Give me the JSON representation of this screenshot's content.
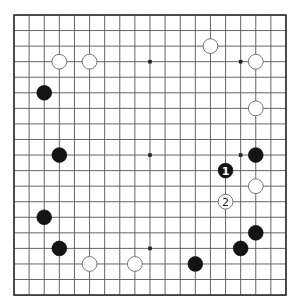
{
  "board": {
    "size": 19,
    "origin": {
      "x": 14,
      "y": 15
    },
    "spacing": {
      "x": 15.11,
      "y": 15.56
    },
    "star_points": [
      [
        3,
        3
      ],
      [
        9,
        3
      ],
      [
        15,
        3
      ],
      [
        3,
        9
      ],
      [
        9,
        9
      ],
      [
        15,
        9
      ],
      [
        3,
        15
      ],
      [
        9,
        15
      ],
      [
        15,
        15
      ]
    ],
    "colors": {
      "line": "#555555",
      "edge": "#333333",
      "black": "#141414",
      "white": "#ffffff"
    }
  },
  "stones": [
    {
      "color": "white",
      "col": 3,
      "row": 3,
      "label": ""
    },
    {
      "color": "white",
      "col": 5,
      "row": 3,
      "label": ""
    },
    {
      "color": "white",
      "col": 13,
      "row": 2,
      "label": ""
    },
    {
      "color": "white",
      "col": 16,
      "row": 3,
      "label": ""
    },
    {
      "color": "white",
      "col": 16,
      "row": 6,
      "label": ""
    },
    {
      "color": "white",
      "col": 16,
      "row": 11,
      "label": ""
    },
    {
      "color": "white",
      "col": 14,
      "row": 12,
      "label": "2"
    },
    {
      "color": "white",
      "col": 5,
      "row": 16,
      "label": ""
    },
    {
      "color": "white",
      "col": 8,
      "row": 16,
      "label": ""
    },
    {
      "color": "black",
      "col": 2,
      "row": 5,
      "label": ""
    },
    {
      "color": "black",
      "col": 3,
      "row": 9,
      "label": ""
    },
    {
      "color": "black",
      "col": 16,
      "row": 9,
      "label": ""
    },
    {
      "color": "black",
      "col": 14,
      "row": 10,
      "label": "1"
    },
    {
      "color": "black",
      "col": 2,
      "row": 13,
      "label": ""
    },
    {
      "color": "black",
      "col": 3,
      "row": 15,
      "label": ""
    },
    {
      "color": "black",
      "col": 16,
      "row": 14,
      "label": ""
    },
    {
      "color": "black",
      "col": 15,
      "row": 15,
      "label": ""
    },
    {
      "color": "black",
      "col": 12,
      "row": 16,
      "label": ""
    }
  ]
}
